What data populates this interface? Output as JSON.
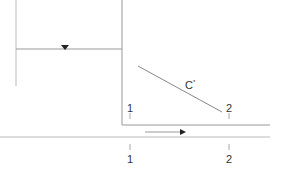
{
  "diagram": {
    "labels": {
      "c_star": "C",
      "c_sup": "*",
      "upper_1": "1",
      "upper_2": "2",
      "lower_1": "1",
      "lower_2": "2"
    },
    "colors": {
      "line": "#999999",
      "arrow": "#222222"
    }
  }
}
